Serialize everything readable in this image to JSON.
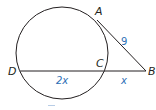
{
  "figure": {
    "type": "geometry-diagram",
    "colors": {
      "stroke": "#231f20",
      "point_label": "#231f20",
      "length_label": "#2e6fb5",
      "background": "#ffffff"
    },
    "circle": {
      "cx": 62,
      "cy": 53,
      "r": 46
    },
    "points": {
      "A": {
        "label": "A",
        "x": 97,
        "y": 20
      },
      "B": {
        "label": "B",
        "x": 146,
        "y": 71
      },
      "C": {
        "label": "C",
        "x": 104,
        "y": 71
      },
      "D": {
        "label": "D",
        "x": 20,
        "y": 71
      }
    },
    "segments": [
      {
        "name": "AB",
        "from": "A",
        "to": "B",
        "kind": "tangent"
      },
      {
        "name": "DB",
        "from": "D",
        "to": "B",
        "kind": "secant"
      }
    ],
    "lengths": {
      "AB": "9",
      "DC": "2x",
      "CB": "x"
    }
  }
}
